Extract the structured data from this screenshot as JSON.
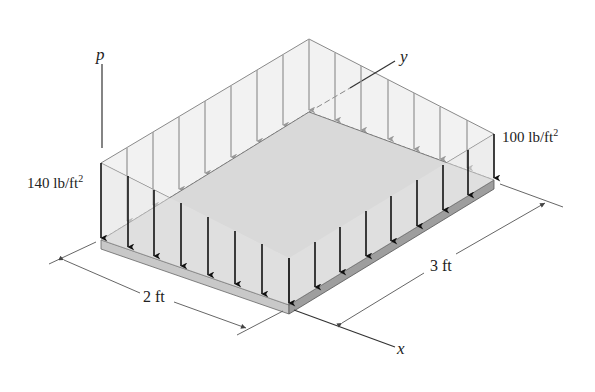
{
  "figure": {
    "type": "3D distributed load on rectangular plate",
    "axis_labels": {
      "p": "p",
      "x": "x",
      "y": "y"
    },
    "loads": {
      "left_value": "140",
      "left_unit": "lb/ft",
      "left_exp": "2",
      "right_value": "100",
      "right_unit": "lb/ft",
      "right_exp": "2"
    },
    "dimensions": {
      "width": "2 ft",
      "length": "3 ft"
    },
    "colors": {
      "load_fill": "#f0f0f0",
      "plate_top": "#d6d6d6",
      "plate_side": "#a8a8a8",
      "front_arrows": "#111111",
      "back_arrows": "#9a9a9a",
      "lines": "#555555"
    }
  }
}
